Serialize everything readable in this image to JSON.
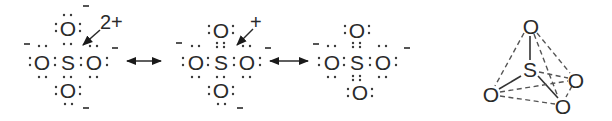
{
  "diagram": {
    "colors": {
      "ink": "#2a2a2a",
      "background": "#ffffff"
    },
    "structures": [
      {
        "id": "resonance-1",
        "central_atom": "S",
        "ligands": [
          "O",
          "O",
          "O",
          "O"
        ],
        "formal_charge_label": "2+",
        "minus_labels": [
          "-",
          "-",
          "-",
          "-"
        ]
      },
      {
        "id": "resonance-2",
        "central_atom": "S",
        "ligands": [
          "O",
          "O",
          "O",
          "O"
        ],
        "formal_charge_label": "+",
        "minus_labels": [
          "-",
          "-",
          "-"
        ]
      },
      {
        "id": "resonance-3",
        "central_atom": "S",
        "ligands": [
          "O",
          "O",
          "O",
          "O"
        ],
        "minus_labels": [
          "-",
          "-"
        ]
      }
    ],
    "resonance_arrows": [
      "double-headed-arrow",
      "double-headed-arrow"
    ],
    "tetrahedron": {
      "central_atom": "S",
      "vertices": [
        "O",
        "O",
        "O",
        "O"
      ]
    }
  }
}
